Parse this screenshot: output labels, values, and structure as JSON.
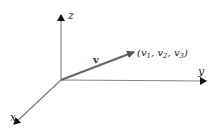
{
  "diagram": {
    "type": "3d-coordinate-axes-with-vector",
    "origin": [
      61,
      80
    ],
    "axes": [
      {
        "name": "z",
        "label": "z",
        "end": [
          61,
          13
        ],
        "color": "#888888",
        "arrow_color": "#111111"
      },
      {
        "name": "y",
        "label": "y",
        "end": [
          208,
          81
        ],
        "color": "#888888",
        "arrow_color": "#222222"
      },
      {
        "name": "x",
        "label": "x",
        "end": [
          12,
          126
        ],
        "color": "#777777",
        "arrow_color": "#111111"
      }
    ],
    "vector": {
      "label": "v",
      "end": [
        136,
        51
      ],
      "color": "#666666",
      "components_label": "(v",
      "components": {
        "open": "(",
        "v": "v",
        "s1": "1",
        "s2": "2",
        "s3": "3",
        "sep": ", ",
        "close": ")"
      }
    }
  }
}
